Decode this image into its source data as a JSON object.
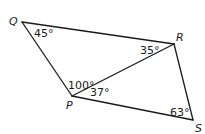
{
  "diagram": {
    "vertices": {
      "Q": {
        "label": "Q",
        "x": 22,
        "y": 22
      },
      "R": {
        "label": "R",
        "x": 174,
        "y": 44
      },
      "S": {
        "label": "S",
        "x": 193,
        "y": 120
      },
      "P": {
        "label": "P",
        "x": 72,
        "y": 96
      }
    },
    "segments": [
      "QR",
      "RS",
      "SP",
      "PQ",
      "PR"
    ],
    "angles": {
      "Q": "45°",
      "R": "35°",
      "P_upper": "100°",
      "P_lower": "37°",
      "S": "63°"
    },
    "line_color": "#1a1a1a"
  }
}
